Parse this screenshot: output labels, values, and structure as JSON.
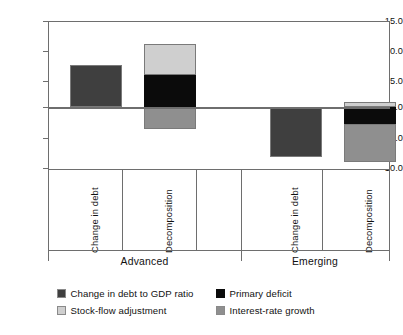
{
  "chart_data": {
    "type": "bar",
    "title": "",
    "subtitle": "",
    "xlabel": "",
    "ylabel": "",
    "ylim": [
      -10.0,
      15.0
    ],
    "ytick_values": [
      15.0,
      10.0,
      5.0,
      0.0,
      -5.0,
      -10.0
    ],
    "ytick_labels": [
      "15.0",
      "10.0",
      "5.0",
      "0.0",
      "-5.0",
      "-10.0"
    ],
    "grid": false,
    "legend_position": "bottom",
    "stacked": true,
    "groups": [
      "Advanced",
      "Emerging"
    ],
    "categories": [
      "Change in debt",
      "Decomposition",
      "Change in debt",
      "Decomposition"
    ],
    "series": [
      {
        "name": "Change in debt to GDP ratio",
        "color": "#3f3f3f",
        "values": [
          6.9,
          null,
          -8.2,
          null
        ]
      },
      {
        "name": "Primary deficit",
        "color": "#0b0b0b",
        "values": [
          null,
          5.2,
          null,
          -2.7
        ]
      },
      {
        "name": "Stock-flow adjustment",
        "color": "#cfcfcf",
        "values": [
          null,
          5.0,
          null,
          0.9
        ]
      },
      {
        "name": "Interest-rate growth",
        "color": "#8f8f8f",
        "values": [
          null,
          -3.6,
          null,
          -6.3
        ]
      }
    ],
    "bars": [
      {
        "group": "Advanced",
        "category": "Change in debt",
        "segments": [
          {
            "series": "Change in debt to GDP ratio",
            "from": 0.0,
            "to": 6.9
          }
        ]
      },
      {
        "group": "Advanced",
        "category": "Decomposition",
        "segments": [
          {
            "series": "Stock-flow adjustment",
            "from": 5.2,
            "to": 10.2
          },
          {
            "series": "Primary deficit",
            "from": 0.0,
            "to": 5.2
          },
          {
            "series": "Interest-rate growth",
            "from": -3.6,
            "to": 0.0
          }
        ]
      },
      {
        "group": "Emerging",
        "category": "Change in debt",
        "segments": [
          {
            "series": "Change in debt to GDP ratio",
            "from": -8.2,
            "to": 0.0
          }
        ]
      },
      {
        "group": "Emerging",
        "category": "Decomposition",
        "segments": [
          {
            "series": "Stock-flow adjustment",
            "from": 0.0,
            "to": 0.9
          },
          {
            "series": "Primary deficit",
            "from": -2.7,
            "to": 0.0
          },
          {
            "series": "Interest-rate growth",
            "from": -9.0,
            "to": -2.7
          }
        ]
      }
    ]
  },
  "axis": {
    "y_labels": [
      "15.0",
      "10.0",
      "5.0",
      "0.0",
      "-5.0",
      "-10.0"
    ]
  },
  "categories": {
    "c0": "Change in debt",
    "c1": "Decomposition",
    "c2": "Change in debt",
    "c3": "Decomposition"
  },
  "groups": {
    "g0": "Advanced",
    "g1": "Emerging"
  },
  "legend": {
    "items": [
      {
        "label": "Change in debt to GDP ratio",
        "color": "#3f3f3f"
      },
      {
        "label": "Primary deficit",
        "color": "#0b0b0b"
      },
      {
        "label": "Stock-flow adjustment",
        "color": "#cfcfcf"
      },
      {
        "label": "Interest-rate growth",
        "color": "#8f8f8f"
      }
    ],
    "l0": "Change in debt to GDP ratio",
    "l1": "Primary deficit",
    "l2": "Stock-flow adjustment",
    "l3": "Interest-rate growth"
  }
}
